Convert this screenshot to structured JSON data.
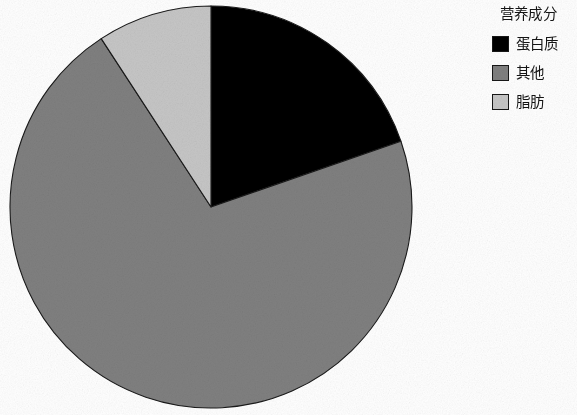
{
  "figure": {
    "background_color": "#ffffff",
    "outline_color": "#1a1a1a"
  },
  "legend": {
    "title": "营养成分",
    "position": "right",
    "items": [
      {
        "label": "蛋白质",
        "color": "#000000",
        "swatch_name": "legend-swatch-protein"
      },
      {
        "label": "其他",
        "color": "#808080",
        "swatch_name": "legend-swatch-other"
      },
      {
        "label": "脂肪",
        "color": "#c6c6c6",
        "swatch_name": "legend-swatch-fat"
      }
    ]
  },
  "chart_data": {
    "type": "pie",
    "title": "",
    "subtitle": "",
    "xlabel": "",
    "ylabel": "",
    "legend_title": "营养成分",
    "legend_position": "right",
    "grid": false,
    "start_angle_deg": 0,
    "direction": "clockwise",
    "center": {
      "x": 211,
      "y": 207
    },
    "radius": 201,
    "categories": [
      "蛋白质",
      "其他",
      "脂肪"
    ],
    "values": [
      19.7,
      71.1,
      9.2
    ],
    "value_unit": "%",
    "colors": [
      "#000000",
      "#808080",
      "#c6c6c6"
    ],
    "slices": [
      {
        "label": "蛋白质",
        "value": 19.7,
        "color": "#000000",
        "start_angle_deg": 0.0,
        "end_angle_deg": 70.9
      },
      {
        "label": "其他",
        "value": 71.1,
        "color": "#808080",
        "start_angle_deg": 70.9,
        "end_angle_deg": 326.9
      },
      {
        "label": "脂肪",
        "value": 9.2,
        "color": "#c6c6c6",
        "start_angle_deg": 326.9,
        "end_angle_deg": 360.0
      }
    ],
    "data_labels_shown": false
  }
}
